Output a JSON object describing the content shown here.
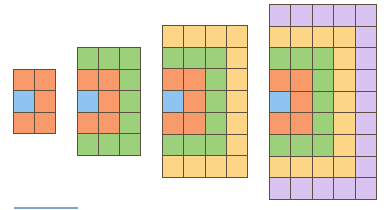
{
  "figure": {
    "colors": {
      "B": "#8fc3f2",
      "O": "#f89a6a",
      "G": "#9dd07a",
      "Y": "#fdd587",
      "P": "#d9c3f0",
      "border": "#5e5040"
    },
    "grids": [
      {
        "name": "grid-1",
        "cols": 2,
        "rows": 3,
        "x": 13,
        "y": 69,
        "w": 43,
        "h": 65,
        "cells": [
          "OO",
          "BO",
          "OO"
        ]
      },
      {
        "name": "grid-2",
        "cols": 3,
        "rows": 5,
        "x": 77,
        "y": 47,
        "w": 64,
        "h": 109,
        "cells": [
          "GGG",
          "OOG",
          "BOG",
          "OOG",
          "GGG"
        ]
      },
      {
        "name": "grid-3",
        "cols": 4,
        "rows": 7,
        "x": 162,
        "y": 25,
        "w": 86,
        "h": 153,
        "cells": [
          "YYYY",
          "GGGY",
          "OOGY",
          "BOGY",
          "OOGY",
          "GGGY",
          "YYYY"
        ]
      },
      {
        "name": "grid-4",
        "cols": 5,
        "rows": 9,
        "x": 269,
        "y": 4,
        "w": 108,
        "h": 196,
        "cells": [
          "PPPPP",
          "YYYYP",
          "GGGYP",
          "OOGYP",
          "BOGYP",
          "OOGYP",
          "GGGYP",
          "YYYYP",
          "PPPPP"
        ]
      }
    ]
  }
}
